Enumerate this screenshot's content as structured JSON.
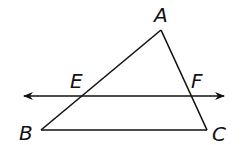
{
  "diagram": {
    "type": "geometry-triangle-with-transversal",
    "stroke_color": "#111111",
    "background": "#ffffff",
    "labels": {
      "A": "A",
      "B": "B",
      "C": "C",
      "E": "E",
      "F": "F"
    },
    "points": {
      "A": [
        161,
        30
      ],
      "B": [
        41,
        130
      ],
      "C": [
        207,
        130
      ],
      "E": [
        82,
        96
      ],
      "F": [
        191,
        96
      ]
    },
    "line_EF": {
      "description": "Line through E and F with arrows at both ends, parallel to BC",
      "y": 96,
      "x_start": 24,
      "x_end": 224
    },
    "segments": [
      "AB",
      "BC",
      "CA"
    ]
  }
}
